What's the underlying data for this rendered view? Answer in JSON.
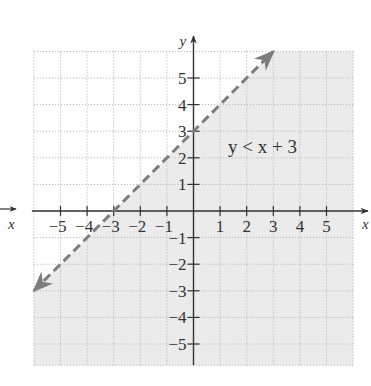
{
  "chart_data": {
    "type": "inequality-graph",
    "title": "",
    "inequality_label": "y < x + 3",
    "boundary": {
      "equation": "y = x + 3",
      "slope": 1,
      "intercept": 3,
      "style": "dashed",
      "endpoints": [
        [
          -6,
          -3
        ],
        [
          3,
          6
        ]
      ]
    },
    "shaded_region": "below the line (y < x + 3)",
    "xlabel": "x",
    "ylabel": "y",
    "xlim": [
      -6,
      6
    ],
    "ylim": [
      -5.8,
      6
    ],
    "x_ticks": [
      -5,
      -4,
      -3,
      -2,
      -1,
      1,
      2,
      3,
      4,
      5
    ],
    "y_ticks": [
      -5,
      -4,
      -3,
      -2,
      -1,
      1,
      2,
      3,
      4,
      5
    ],
    "x_tick_labels": [
      "−5",
      "−4",
      "−3",
      "−2",
      "−1",
      "1",
      "2",
      "3",
      "4",
      "5"
    ],
    "y_tick_labels": [
      "−5",
      "−4",
      "−3",
      "−2",
      "−1",
      "1",
      "2",
      "3",
      "4",
      "5"
    ],
    "grid": true,
    "colors": {
      "shade": "#ebebeb",
      "grid": "#b8b8b8",
      "boundary": "#7d7d7d",
      "axis": "#333333"
    }
  }
}
